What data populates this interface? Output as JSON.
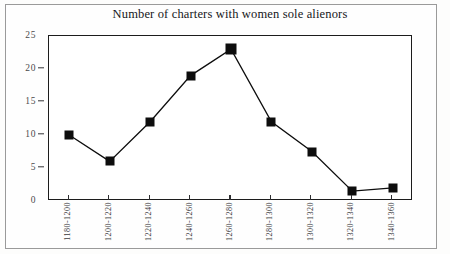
{
  "chart_data": {
    "type": "line",
    "title": "Number of charters with women sole alienors",
    "xlabel": "",
    "ylabel": "",
    "categories": [
      "1180-1200",
      "1200-1220",
      "1220-1240",
      "1240-1260",
      "1260-1280",
      "1280-1300",
      "1300-1320",
      "1320-1340",
      "1340-1360"
    ],
    "values": [
      10,
      6,
      12,
      19,
      23,
      12,
      7.5,
      1.5,
      2
    ],
    "ylim": [
      0,
      25
    ],
    "yticks": [
      0,
      5,
      10,
      15,
      20,
      25
    ],
    "ytick_labels": [
      "0",
      "5",
      "10",
      "15",
      "20",
      "25"
    ],
    "grid": false,
    "legend": false,
    "marker": "filled-square",
    "line_color": "#0d0d0d",
    "marker_color": "#0d0d0d"
  },
  "figure": {
    "title": "Number of charters with women sole alienors"
  }
}
